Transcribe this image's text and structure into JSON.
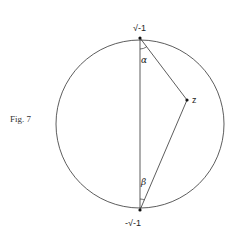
{
  "figure": {
    "caption": "Fig. 7",
    "points": {
      "top": {
        "label": "√-1",
        "x": 140,
        "y": 38
      },
      "bottom": {
        "label": "-√-1",
        "x": 140,
        "y": 210
      },
      "z": {
        "label": "z",
        "x": 187,
        "y": 100
      }
    },
    "angles": {
      "alpha": "α",
      "beta": "β"
    },
    "circle": {
      "cx": 140,
      "cy": 124,
      "r": 84
    },
    "colors": {
      "stroke": "#333333",
      "background": "#ffffff"
    }
  }
}
